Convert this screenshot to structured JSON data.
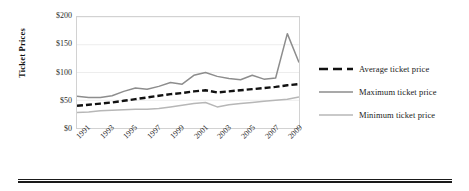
{
  "chart_data": {
    "type": "line",
    "title": "",
    "xlabel": "",
    "ylabel": "Ticket Prices",
    "x": [
      1991,
      1992,
      1993,
      1994,
      1995,
      1996,
      1997,
      1998,
      1999,
      2000,
      2001,
      2002,
      2003,
      2004,
      2005,
      2006,
      2007,
      2008,
      2009,
      2010
    ],
    "tick_labels_x": [
      "1991",
      "1993",
      "1995",
      "1997",
      "1999",
      "2001",
      "2003",
      "2005",
      "2007",
      "2009"
    ],
    "tick_labels_y": [
      "$0",
      "$50",
      "$100",
      "$150",
      "$200"
    ],
    "ylim": [
      0,
      200
    ],
    "xlim": [
      1991,
      2010
    ],
    "grid": true,
    "legend_position": "right",
    "series": [
      {
        "name": "Average ticket price",
        "style": "dashed",
        "color": "#111111",
        "values": [
          40,
          42,
          44,
          46,
          49,
          52,
          55,
          58,
          61,
          63,
          66,
          68,
          64,
          66,
          68,
          70,
          72,
          74,
          77,
          79
        ]
      },
      {
        "name": "Maximum ticket price",
        "style": "solid",
        "color": "#8d8d8d",
        "values": [
          57,
          55,
          55,
          58,
          66,
          72,
          70,
          75,
          82,
          79,
          95,
          100,
          93,
          89,
          87,
          95,
          88,
          90,
          170,
          118
        ]
      },
      {
        "name": "Minimum ticket price",
        "style": "solid",
        "color": "#b7b7b7",
        "values": [
          28,
          29,
          31,
          32,
          33,
          34,
          34,
          35,
          38,
          41,
          44,
          46,
          38,
          42,
          44,
          46,
          48,
          50,
          52,
          56
        ]
      }
    ]
  },
  "axes": {
    "y_title": "Ticket Prices"
  },
  "legend": {
    "items": [
      {
        "label": "Average ticket price",
        "marker": "dashed-line-marker"
      },
      {
        "label": "Maximum ticket price",
        "marker": "solid-line-marker"
      },
      {
        "label": "Minimum ticket price",
        "marker": "solid-line-marker"
      }
    ]
  }
}
